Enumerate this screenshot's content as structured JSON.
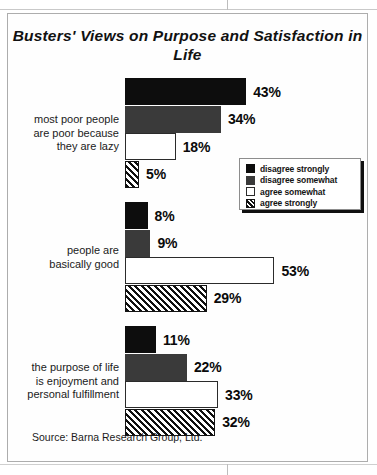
{
  "chart_data": {
    "type": "bar",
    "orientation": "horizontal",
    "title": "Busters' Views on Purpose and Satisfaction in Life",
    "xlabel": "",
    "ylabel": "",
    "xlim": [
      0,
      60
    ],
    "grid": false,
    "legend_position": "inside-upper-right",
    "categories": [
      "most poor people\nare poor because\nthey are lazy",
      "people are\nbasically good",
      "the purpose of life\nis enjoyment and\npersonal fulfillment"
    ],
    "series": [
      {
        "name": "disagree strongly",
        "color": "#0d0d0d",
        "pattern": "solid",
        "values": [
          43,
          8,
          11
        ]
      },
      {
        "name": "disagree somewhat",
        "color": "#3a3a3a",
        "pattern": "solid",
        "values": [
          34,
          9,
          22
        ]
      },
      {
        "name": "agree somewhat",
        "color": "#ffffff",
        "pattern": "outline",
        "values": [
          18,
          53,
          33
        ]
      },
      {
        "name": "agree strongly",
        "color": "#ffffff",
        "pattern": "diagonal-hatch",
        "values": [
          5,
          29,
          32
        ]
      }
    ],
    "source": "Source: Barna Research Group, Ltd."
  },
  "figure": {
    "title": "Busters' Views on Purpose and Satisfaction in Life",
    "source": "Source: Barna Research Group, Ltd."
  },
  "groups": [
    {
      "label_lines": [
        "most poor people",
        "are poor because",
        "they are lazy"
      ],
      "bars": [
        {
          "series": "disagree strongly",
          "value": 43,
          "value_label": "43%"
        },
        {
          "series": "disagree somewhat",
          "value": 34,
          "value_label": "34%"
        },
        {
          "series": "agree somewhat",
          "value": 18,
          "value_label": "18%"
        },
        {
          "series": "agree strongly",
          "value": 5,
          "value_label": "5%"
        }
      ]
    },
    {
      "label_lines": [
        "people are",
        "basically good"
      ],
      "bars": [
        {
          "series": "disagree strongly",
          "value": 8,
          "value_label": "8%"
        },
        {
          "series": "disagree somewhat",
          "value": 9,
          "value_label": "9%"
        },
        {
          "series": "agree somewhat",
          "value": 53,
          "value_label": "53%"
        },
        {
          "series": "agree strongly",
          "value": 29,
          "value_label": "29%"
        }
      ]
    },
    {
      "label_lines": [
        "the purpose of life",
        "is enjoyment and",
        "personal fulfillment"
      ],
      "bars": [
        {
          "series": "disagree strongly",
          "value": 11,
          "value_label": "11%"
        },
        {
          "series": "disagree somewhat",
          "value": 22,
          "value_label": "22%"
        },
        {
          "series": "agree somewhat",
          "value": 33,
          "value_label": "33%"
        },
        {
          "series": "agree strongly",
          "value": 32,
          "value_label": "32%"
        }
      ]
    }
  ],
  "legend": {
    "items": [
      {
        "label": "disagree strongly",
        "swatch": "solid-black"
      },
      {
        "label": "disagree somewhat",
        "swatch": "solid-dark-gray"
      },
      {
        "label": "agree somewhat",
        "swatch": "outline-white"
      },
      {
        "label": "agree strongly",
        "swatch": "diagonal-hatch"
      }
    ]
  },
  "scale": {
    "px_per_percent": 2.82
  }
}
